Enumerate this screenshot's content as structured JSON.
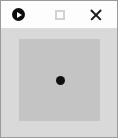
{
  "window": {
    "name": "media-viewer-window",
    "width": 118,
    "height": 138,
    "frame_border_color": "#9a9a9a"
  },
  "title_bar": {
    "background_color": "#fdfdfd",
    "title": "",
    "buttons": [
      {
        "name": "app-menu-button",
        "icon": "play-circle-icon",
        "label": "",
        "color": "#0d0d0d"
      },
      {
        "name": "maximize-button",
        "icon": "square-outline-icon",
        "label": "",
        "color": "#d2d2d2"
      },
      {
        "name": "close-button",
        "icon": "close-x-icon",
        "label": "",
        "color": "#1b1b1b"
      }
    ]
  },
  "content": {
    "name": "canvas-area",
    "background_color": "#d9d9d9",
    "inner_panel": {
      "name": "inner-panel",
      "background_color": "#c4c4c4",
      "label": ""
    },
    "marker": {
      "name": "center-dot-marker",
      "color": "#101010",
      "label": ""
    }
  }
}
